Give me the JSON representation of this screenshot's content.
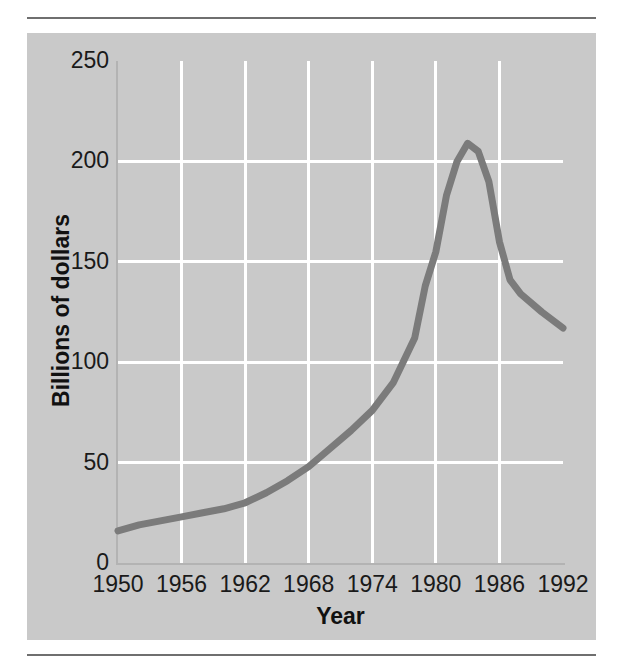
{
  "figure": {
    "panel_background": "#c9c9c9",
    "rule_color": "#6f6f6f"
  },
  "chart_data": {
    "type": "line",
    "title": "",
    "subtitle": "",
    "xlabel": "Year",
    "ylabel": "Billions of dollars",
    "xlim": [
      1950,
      1992
    ],
    "ylim": [
      0,
      250
    ],
    "xticks": [
      1950,
      1956,
      1962,
      1968,
      1974,
      1980,
      1986,
      1992
    ],
    "xtick_labels": [
      "1950",
      "1956",
      "1962",
      "1968",
      "1974",
      "1980",
      "1986",
      "1992"
    ],
    "yticks": [
      0,
      50,
      100,
      150,
      200,
      250
    ],
    "ytick_labels": [
      "0",
      "50",
      "100",
      "150",
      "200",
      "250"
    ],
    "grid": true,
    "grid_color": "#ffffff",
    "grid_axis": "both",
    "legend": null,
    "legend_position": "none",
    "line_color": "#7b7b7b",
    "line_width": 7,
    "series": [
      {
        "name": "Billions of dollars",
        "x": [
          1950,
          1952,
          1954,
          1956,
          1958,
          1960,
          1962,
          1964,
          1966,
          1968,
          1970,
          1972,
          1974,
          1976,
          1978,
          1979,
          1980,
          1981,
          1982,
          1983,
          1984,
          1985,
          1986,
          1987,
          1988,
          1990,
          1992
        ],
        "values": [
          16,
          19,
          21,
          23,
          25,
          27,
          30,
          35,
          41,
          48,
          57,
          66,
          76,
          90,
          112,
          138,
          155,
          183,
          200,
          209,
          205,
          190,
          160,
          141,
          134,
          125,
          117
        ]
      }
    ],
    "annotations": []
  }
}
